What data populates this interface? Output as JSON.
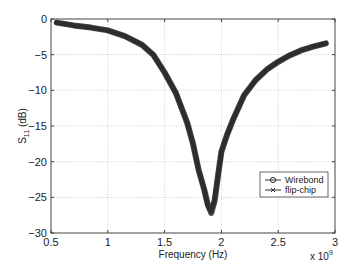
{
  "chart_data": {
    "type": "line",
    "title": "",
    "xlabel": "Frequency (Hz)",
    "ylabel": "S11 (dB)",
    "ylabel_main": "S",
    "ylabel_sub": "11",
    "ylabel_unit": " (dB)",
    "x_multiplier": "x 10",
    "x_multiplier_exp": "9",
    "xlim": [
      0.5,
      3
    ],
    "ylim": [
      -30,
      0
    ],
    "xticks": [
      0.5,
      1,
      1.5,
      2,
      2.5,
      3
    ],
    "xtick_labels": [
      "0.5",
      "1",
      "1.5",
      "2",
      "2.5",
      "3"
    ],
    "yticks": [
      0,
      -5,
      -10,
      -15,
      -20,
      -25,
      -30
    ],
    "ytick_labels": [
      "0",
      "−5",
      "−10",
      "−15",
      "−20",
      "−25",
      "−30"
    ],
    "grid": true,
    "legend_position": "lower right",
    "series": [
      {
        "name": "Wirebond",
        "marker": "o",
        "x": [
          0.55,
          0.7,
          0.85,
          1.0,
          1.15,
          1.3,
          1.4,
          1.5,
          1.6,
          1.7,
          1.75,
          1.8,
          1.85,
          1.88,
          1.91,
          1.94,
          1.97,
          2.0,
          2.05,
          2.1,
          2.2,
          2.3,
          2.4,
          2.5,
          2.6,
          2.7,
          2.8,
          2.92
        ],
        "y": [
          -0.5,
          -0.9,
          -1.2,
          -1.6,
          -2.4,
          -3.6,
          -5.0,
          -7.5,
          -10.4,
          -14.6,
          -17.5,
          -21.2,
          -24.0,
          -26.0,
          -27.2,
          -25.5,
          -22.0,
          -18.6,
          -16.2,
          -14.2,
          -10.7,
          -8.6,
          -7.1,
          -6.0,
          -5.1,
          -4.4,
          -3.9,
          -3.4
        ]
      },
      {
        "name": "flip-chip",
        "marker": "x",
        "x": [
          0.55,
          0.7,
          0.85,
          1.0,
          1.15,
          1.3,
          1.4,
          1.5,
          1.6,
          1.7,
          1.75,
          1.8,
          1.85,
          1.88,
          1.91,
          1.94,
          1.97,
          2.0,
          2.05,
          2.1,
          2.2,
          2.3,
          2.4,
          2.5,
          2.6,
          2.7,
          2.8,
          2.92
        ],
        "y": [
          -0.5,
          -0.9,
          -1.2,
          -1.6,
          -2.4,
          -3.6,
          -5.0,
          -7.5,
          -10.4,
          -14.6,
          -17.5,
          -21.2,
          -24.0,
          -26.2,
          -27.0,
          -25.3,
          -22.0,
          -18.6,
          -16.2,
          -14.2,
          -10.7,
          -8.6,
          -7.1,
          -6.0,
          -5.1,
          -4.4,
          -3.9,
          -3.4
        ]
      }
    ]
  },
  "colors": {
    "curve": "#2a2a2a",
    "grid": "#bbbbbb",
    "axis": "#444444"
  }
}
